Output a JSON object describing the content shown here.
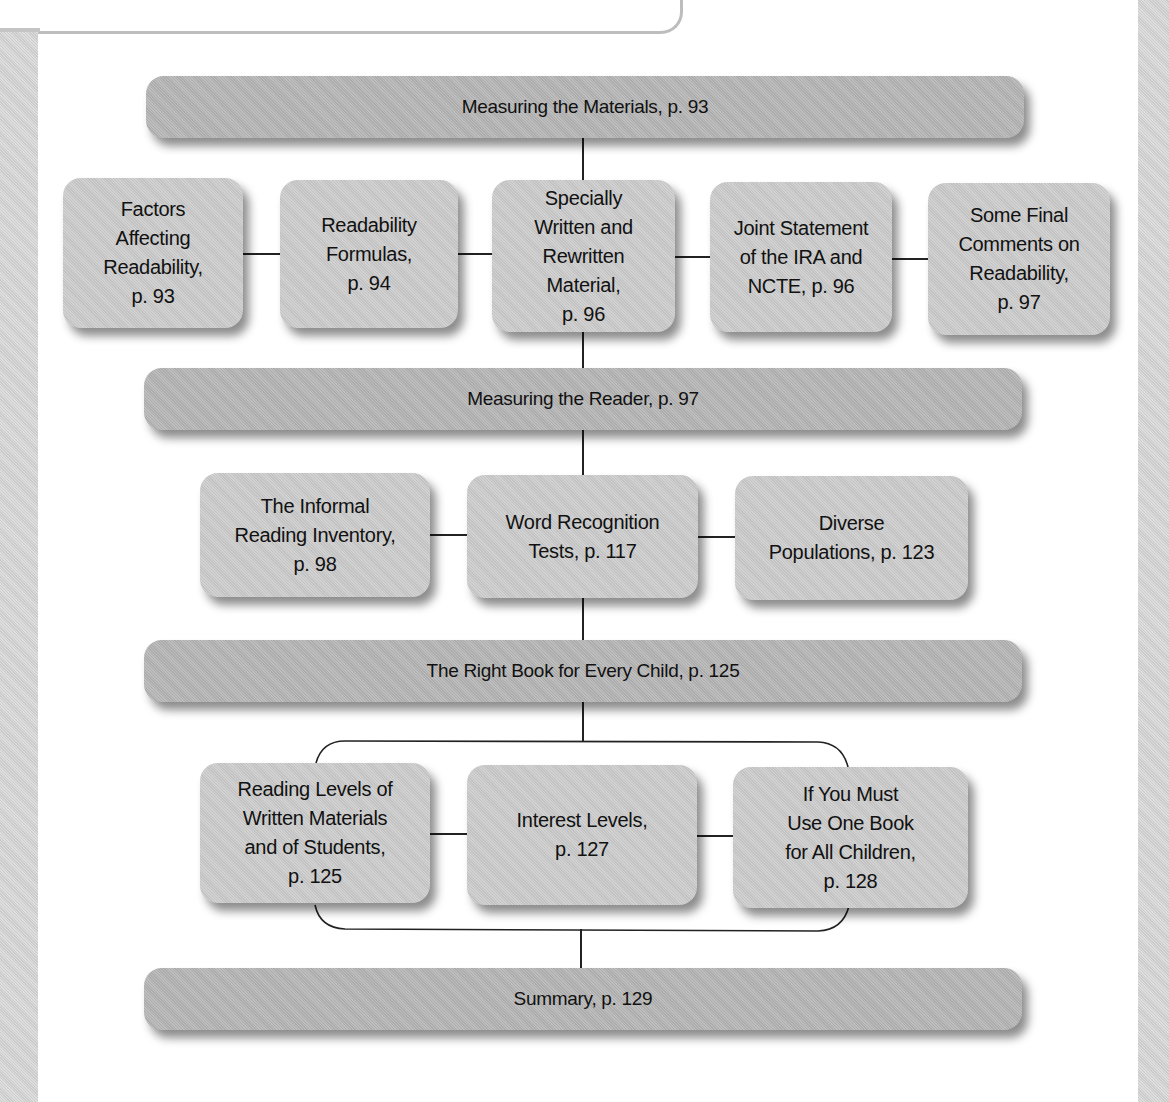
{
  "diagram": {
    "sections": [
      {
        "id": "materials",
        "label": "Measuring the Materials, p. 93",
        "children": [
          {
            "label": "Factors\nAffecting\nReadability,\np. 93"
          },
          {
            "label": "Readability\nFormulas,\np. 94"
          },
          {
            "label": "Specially\nWritten and\nRewritten\nMaterial,\np. 96"
          },
          {
            "label": "Joint Statement\nof the IRA and\nNCTE, p. 96"
          },
          {
            "label": "Some Final\nComments on\nReadability,\np. 97"
          }
        ]
      },
      {
        "id": "reader",
        "label": "Measuring the Reader, p. 97",
        "children": [
          {
            "label": "The Informal\nReading Inventory,\np. 98"
          },
          {
            "label": "Word Recognition\nTests, p. 117"
          },
          {
            "label": "Diverse\nPopulations, p. 123"
          }
        ]
      },
      {
        "id": "right-book",
        "label": "The Right Book for Every Child, p. 125",
        "children": [
          {
            "label": "Reading Levels of\nWritten Materials\nand of Students,\np. 125"
          },
          {
            "label": "Interest Levels,\np. 127"
          },
          {
            "label": "If You Must\nUse One Book\nfor All Children,\np. 128"
          }
        ]
      },
      {
        "id": "summary",
        "label": "Summary, p. 129",
        "children": []
      }
    ],
    "colors": {
      "bar_fill": "#b5b5b5",
      "box_fill": "#cacaca",
      "connector": "#222222",
      "side_strip": "#d3d3d3"
    }
  }
}
